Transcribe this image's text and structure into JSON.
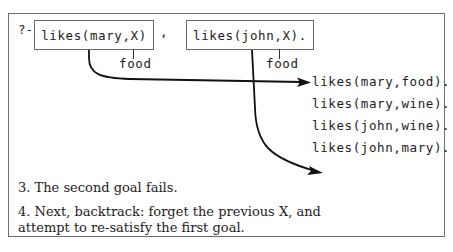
{
  "query": {
    "prompt": "?-",
    "goal1": "likes(mary,X)",
    "separator": ",",
    "goal2": "likes(john,X).",
    "goal1_binding": "food",
    "goal2_binding": "food"
  },
  "database": {
    "facts": [
      "likes(mary,food).",
      "likes(mary,wine).",
      "likes(john,wine).",
      "likes(john,mary)."
    ]
  },
  "steps": [
    {
      "text": "3. The second goal fails."
    },
    {
      "text": "4. Next, backtrack:  forget the previous X, and"
    },
    {
      "text": "attempt to re-satisfy the first goal."
    }
  ],
  "colors": {
    "line": "#111111",
    "border": "#6e6e6e",
    "text": "#222222"
  }
}
